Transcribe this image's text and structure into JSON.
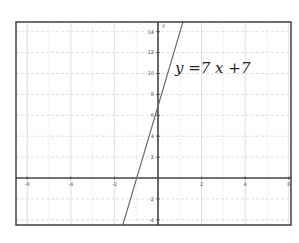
{
  "chart_data": {
    "type": "line",
    "title": "",
    "xlabel": "",
    "ylabel": "y",
    "xlim": [
      -6.5,
      6
    ],
    "ylim": [
      -4.3,
      15
    ],
    "grid": true,
    "x_ticks": [
      -6,
      -4,
      -2,
      2,
      4,
      6
    ],
    "y_ticks": [
      -4,
      -2,
      2,
      4,
      6,
      8,
      10,
      12,
      14
    ],
    "x_tick_labels": [
      "-6",
      "-4",
      "-2",
      "2",
      "4",
      "6"
    ],
    "y_tick_labels": [
      "-4",
      "-2",
      "2",
      "4",
      "6",
      "8",
      "10",
      "12",
      "14"
    ],
    "series": [
      {
        "name": "y = 7x + 7",
        "slope": 7,
        "intercept": 7,
        "x": [
          -1.61,
          -1,
          0,
          1,
          1.14
        ],
        "y": [
          -4.3,
          0,
          7,
          14,
          15
        ]
      }
    ],
    "annotations": [
      {
        "text": "y =7 x +7",
        "x": 1.9,
        "y": 10.5
      }
    ]
  },
  "labels": {
    "y_axis_name": "y",
    "equation": "y =7 x +7"
  },
  "colors": {
    "frame": "#333333",
    "axis": "#444444",
    "grid": "#d6d6d6",
    "line": "#666666"
  }
}
